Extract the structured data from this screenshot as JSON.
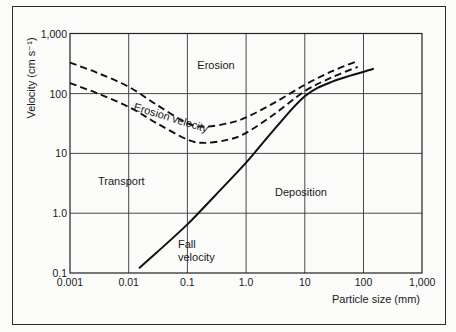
{
  "chart_data": {
    "type": "line",
    "title": "",
    "xlabel": "Particle size (mm)",
    "ylabel": "Velocity (cm s⁻¹)",
    "xscale": "log",
    "yscale": "log",
    "xlim": [
      0.001,
      1000
    ],
    "ylim": [
      0.1,
      1000
    ],
    "grid": true,
    "x_ticks": [
      "0.001",
      "0.01",
      "0.1",
      "1.0",
      "10",
      "100",
      "1,000"
    ],
    "y_ticks": [
      "0.1",
      "1.0",
      "10",
      "100",
      "1,000"
    ],
    "series": [
      {
        "name": "Erosion velocity (upper bound)",
        "style": "dashed",
        "x": [
          0.001,
          0.003,
          0.01,
          0.03,
          0.1,
          0.2,
          0.5,
          1,
          3,
          10,
          30,
          80
        ],
        "y": [
          330,
          220,
          130,
          65,
          32,
          28,
          32,
          40,
          70,
          140,
          240,
          350
        ]
      },
      {
        "name": "Erosion velocity (lower bound)",
        "style": "dashed",
        "x": [
          0.001,
          0.003,
          0.01,
          0.03,
          0.1,
          0.2,
          0.5,
          1,
          3,
          10,
          30,
          80
        ],
        "y": [
          150,
          100,
          60,
          32,
          17,
          15,
          17,
          22,
          45,
          110,
          190,
          280
        ]
      },
      {
        "name": "Fall velocity",
        "style": "solid",
        "x": [
          0.015,
          0.03,
          0.1,
          0.3,
          1,
          3,
          10,
          30,
          150
        ],
        "y": [
          0.12,
          0.22,
          0.65,
          2.0,
          7,
          25,
          90,
          160,
          260
        ]
      }
    ],
    "annotations": [
      {
        "text": "Erosion",
        "x": 0.5,
        "y": 400
      },
      {
        "text": "Erosion velocity",
        "x": 0.1,
        "y": 30
      },
      {
        "text": "Transport",
        "x": 0.004,
        "y": 4
      },
      {
        "text": "Deposition",
        "x": 10,
        "y": 1.5
      },
      {
        "text": "Fall velocity",
        "x": 0.15,
        "y": 0.2
      }
    ]
  },
  "labels": {
    "ylabel": "Velocity (cm s⁻¹)",
    "xlabel": "Particle size (mm)",
    "x_ticks": [
      "0.001",
      "0.01",
      "0.1",
      "1.0",
      "10",
      "100",
      "1,000"
    ],
    "y_ticks": [
      "0.1",
      "1.0",
      "10",
      "100",
      "1,000"
    ],
    "region_erosion": "Erosion",
    "curve_erosion_velocity": "Erosion velocity",
    "region_transport": "Transport",
    "region_deposition": "Deposition",
    "fall_line1": "Fall",
    "fall_line2": "velocity"
  }
}
